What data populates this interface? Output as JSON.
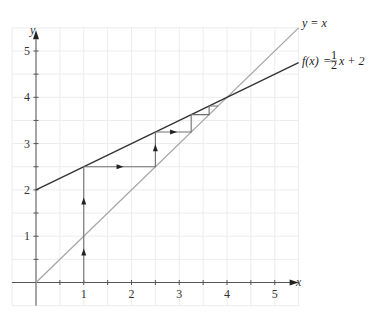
{
  "chart_data": {
    "type": "line",
    "title": "",
    "xlabel": "x",
    "ylabel": "y",
    "xlim": [
      -0.5,
      5.5
    ],
    "ylim": [
      -0.5,
      5.5
    ],
    "grid": true,
    "grid_step": 0.5,
    "x_ticks": [
      1,
      2,
      3,
      4,
      5
    ],
    "y_ticks": [
      1,
      2,
      3,
      4,
      5
    ],
    "x_minor_ticks": [
      0.5,
      1.5,
      2.5,
      3.5,
      4.5
    ],
    "y_minor_ticks": [
      0.5,
      1.5,
      2.5,
      3.5,
      4.5
    ],
    "series": [
      {
        "name": "y = x",
        "label_parts": [
          "y = x"
        ],
        "color": "#a6a6a6",
        "x": [
          0,
          5.5
        ],
        "y": [
          0,
          5.5
        ]
      },
      {
        "name": "f(x) = 1/2 x + 2",
        "color": "#333333",
        "x": [
          0,
          5.5
        ],
        "y": [
          2,
          4.75
        ]
      },
      {
        "name": "cobweb iteration",
        "color": "#6e6e6e",
        "x": [
          1,
          1,
          2.5,
          2.5,
          3.25,
          3.25,
          3.625,
          3.625,
          3.8125
        ],
        "y": [
          0,
          2.5,
          2.5,
          3.25,
          3.25,
          3.625,
          3.625,
          3.8125,
          3.8125
        ]
      }
    ],
    "arrows": [
      {
        "x": 1,
        "y": 0.65,
        "dir": "up"
      },
      {
        "x": 1,
        "y": 1.75,
        "dir": "up"
      },
      {
        "x": 1.75,
        "y": 2.5,
        "dir": "right"
      },
      {
        "x": 2.5,
        "y": 2.9,
        "dir": "up"
      },
      {
        "x": 2.87,
        "y": 3.25,
        "dir": "right"
      }
    ],
    "annotations": [
      {
        "text": "y = x",
        "at": [
          5.5,
          5.5
        ]
      },
      {
        "text": "f(x) = ½x + 2",
        "at": [
          5.5,
          4.75
        ]
      }
    ],
    "fixed_point": [
      4,
      4
    ]
  },
  "labels": {
    "x_axis": "x",
    "y_axis": "y",
    "identity_line": "y = x",
    "function_f": "f(x)",
    "function_eq": "=",
    "function_num": "1",
    "function_den": "2",
    "function_rest": "x + 2"
  }
}
